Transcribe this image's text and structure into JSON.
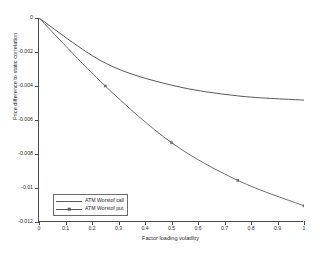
{
  "chart_data": {
    "type": "line",
    "title": "",
    "xlabel": "Factor loading volatility",
    "ylabel": "Price difference to static correlation",
    "xlim": [
      0,
      1
    ],
    "ylim": [
      -0.012,
      0
    ],
    "grid": false,
    "legend_position": "lower left",
    "xticks": [
      "0",
      "0.1",
      "0.2",
      "0.3",
      "0.4",
      "0.5",
      "0.6",
      "0.7",
      "0.8",
      "0.9",
      "1"
    ],
    "xtick_values": [
      0,
      0.1,
      0.2,
      0.3,
      0.4,
      0.5,
      0.6,
      0.7,
      0.8,
      0.9,
      1
    ],
    "yticks": [
      "0",
      "-0.002",
      "-0.004",
      "-0.006",
      "-0.008",
      "-0.01",
      "-0.012"
    ],
    "ytick_values": [
      0,
      -0.002,
      -0.004,
      -0.006,
      -0.008,
      -0.01,
      -0.012
    ],
    "x": [
      0,
      0.25,
      0.5,
      0.75,
      1
    ],
    "series": [
      {
        "name": "ATM Worstof call",
        "color": "#5a5a5a",
        "marker": "square",
        "values": [
          0,
          -0.00265,
          -0.00395,
          -0.00458,
          -0.00483
        ]
      },
      {
        "name": "ATM Worstof put",
        "color": "#6e6e6e",
        "marker": "square",
        "values": [
          0,
          -0.004,
          -0.00733,
          -0.00955,
          -0.01105
        ]
      }
    ]
  },
  "legend": {
    "entries": [
      {
        "label": "ATM Worstof call"
      },
      {
        "label": "ATM Worstof put"
      }
    ]
  },
  "colors": {
    "axis": "#4a4a4a",
    "text": "#1f1f1f",
    "background": "#ffffff",
    "series_call": "#5a5a5a",
    "series_put": "#6e6e6e"
  }
}
